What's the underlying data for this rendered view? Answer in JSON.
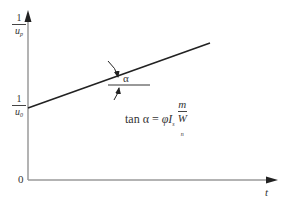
{
  "diagram": {
    "y_axis": {
      "top_label": {
        "numerator": "1",
        "denominator": "u",
        "subscript": "p"
      },
      "intercept_label": {
        "numerator": "1",
        "denominator": "u",
        "subscript": "0"
      }
    },
    "x_axis": {
      "label": "t"
    },
    "origin_label": "0",
    "angle_label": "α",
    "formula": {
      "lhs": "tan α =",
      "phi": "φ",
      "i": "I",
      "i_sub": "s",
      "frac_num": "m",
      "frac_den": "W",
      "frac_den_sub": "n"
    },
    "colors": {
      "axis": "#9a9a9a",
      "line": "#222222",
      "text": "#333333"
    }
  }
}
